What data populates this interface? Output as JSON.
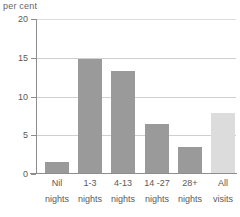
{
  "chart_data": {
    "type": "bar",
    "title": "",
    "ylabel": "per cent",
    "xlabel": "",
    "ylim": [
      0,
      20
    ],
    "yticks": [
      0,
      5,
      10,
      15,
      20
    ],
    "ytick_labels": [
      "0",
      "5",
      "10",
      "15",
      "20"
    ],
    "grid": true,
    "legend": "none",
    "categories": [
      "Nil nights",
      "1-3 nights",
      "4-13 nights",
      "14 -27 nights",
      "28+ nights",
      "All visits"
    ],
    "category_lines": [
      {
        "line1": "Nil",
        "line2": "nights"
      },
      {
        "line1": "1-3",
        "line2": "nights"
      },
      {
        "line1": "4-13",
        "line2": "nights"
      },
      {
        "line1": "14 -27",
        "line2": "nights"
      },
      {
        "line1": "28+",
        "line2": "nights"
      },
      {
        "line1": "All",
        "line2": "visits"
      }
    ],
    "values": [
      1.6,
      14.8,
      13.3,
      6.5,
      3.5,
      7.9
    ],
    "bar_colors": [
      "#9a9a9a",
      "#9a9a9a",
      "#9a9a9a",
      "#9a9a9a",
      "#9a9a9a",
      "#dcdcdc"
    ],
    "axis_color": "#8d8d8d",
    "grid_color": "#cfcfcf",
    "text_color": "#595959"
  }
}
